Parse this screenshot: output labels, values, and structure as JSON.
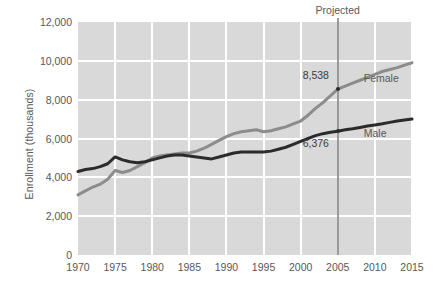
{
  "chart_data": {
    "type": "line",
    "title": "",
    "xlabel": "",
    "ylabel": "Enrollment (thousands)",
    "xlim": [
      1970,
      2015
    ],
    "ylim": [
      0,
      12000
    ],
    "grid": true,
    "legend_position": "inline-right",
    "y_ticks": [
      0,
      2000,
      4000,
      6000,
      8000,
      10000,
      12000
    ],
    "y_tick_labels": [
      "0",
      "2,000",
      "4,000",
      "6,000",
      "8,000",
      "10,000",
      "12,000"
    ],
    "x_ticks": [
      1970,
      1975,
      1980,
      1985,
      1990,
      1995,
      2000,
      2005,
      2010,
      2015
    ],
    "x_tick_labels": [
      "1970",
      "1975",
      "1980",
      "1985",
      "1990",
      "1995",
      "2000",
      "2005",
      "2010",
      "2015"
    ],
    "x": [
      1970,
      1971,
      1972,
      1973,
      1974,
      1975,
      1976,
      1977,
      1978,
      1979,
      1980,
      1981,
      1982,
      1983,
      1984,
      1985,
      1986,
      1987,
      1988,
      1989,
      1990,
      1991,
      1992,
      1993,
      1994,
      1995,
      1996,
      1997,
      1998,
      1999,
      2000,
      2001,
      2002,
      2003,
      2004,
      2005,
      2006,
      2007,
      2008,
      2009,
      2010,
      2011,
      2012,
      2013,
      2014,
      2015
    ],
    "series": [
      {
        "name": "Female",
        "color": "#8c8c8c",
        "values": [
          3100,
          3300,
          3500,
          3650,
          3900,
          4350,
          4250,
          4350,
          4550,
          4750,
          5000,
          5100,
          5150,
          5200,
          5250,
          5250,
          5350,
          5500,
          5700,
          5900,
          6100,
          6250,
          6350,
          6400,
          6450,
          6350,
          6400,
          6500,
          6600,
          6750,
          6900,
          7200,
          7550,
          7850,
          8200,
          8538,
          8700,
          8850,
          9000,
          9150,
          9300,
          9450,
          9550,
          9650,
          9780,
          9900
        ]
      },
      {
        "name": "Male",
        "color": "#2b2b2b",
        "values": [
          4300,
          4400,
          4450,
          4550,
          4700,
          5050,
          4900,
          4800,
          4750,
          4800,
          4900,
          5000,
          5100,
          5150,
          5150,
          5100,
          5050,
          5000,
          4950,
          5050,
          5150,
          5250,
          5300,
          5300,
          5300,
          5300,
          5350,
          5450,
          5550,
          5700,
          5850,
          6000,
          6150,
          6250,
          6320,
          6376,
          6450,
          6500,
          6570,
          6640,
          6700,
          6760,
          6830,
          6900,
          6950,
          7000
        ]
      }
    ],
    "annotations": [
      {
        "name": "projected-divider",
        "label": "Projected",
        "x": 2005
      },
      {
        "name": "female-2005-value",
        "label": "8,538",
        "x": 2005,
        "y": 8538,
        "series": "Female"
      },
      {
        "name": "male-2005-value",
        "label": "6,376",
        "x": 2005,
        "y": 6376,
        "series": "Male"
      }
    ],
    "colors": {
      "plot_background": "#d9d9d9",
      "gridline": "#ffffff",
      "female_line": "#8c8c8c",
      "male_line": "#2b2b2b",
      "projected_line": "#9a9a9a",
      "text": "#58585a"
    }
  }
}
